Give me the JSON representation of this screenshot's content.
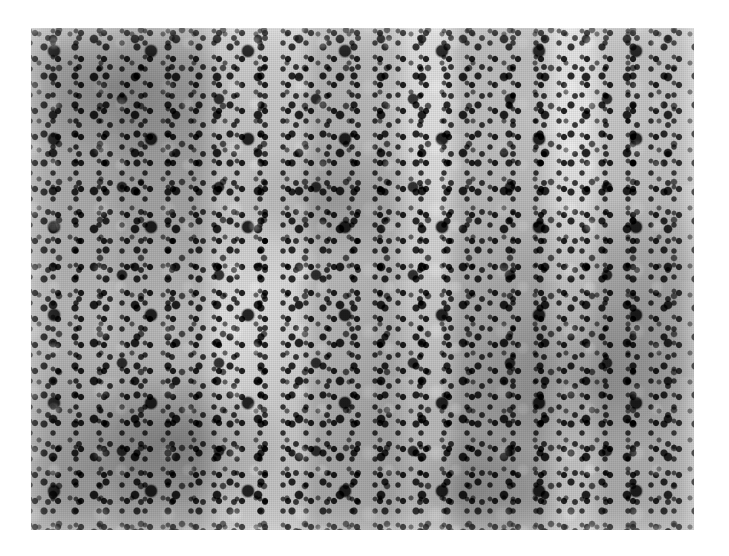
{
  "image": {
    "kind": "photomicrograph",
    "modality": "light-microscopy",
    "staining_appearance": "grayscale halftone print, hematoxylin-eosin-like contrast",
    "subject": "dense cellular infiltrate of small dark-staining nuclei on a pale tissue background",
    "orientation": "landscape",
    "canvas": {
      "width_px": 729,
      "height_px": 556,
      "background_color": "#ffffff"
    },
    "plate": {
      "left_px": 31,
      "top_px": 28,
      "width_px": 663,
      "height_px": 502,
      "border": "none",
      "mean_background_color": "#cfcfcf",
      "darkest_feature_color": "#0a0a0a",
      "lightest_feature_color": "#f2f2f2"
    },
    "features": [
      {
        "name": "small-dark-nuclei",
        "description": "numerous small round hyperchromatic nuclei distributed uniformly across the whole field",
        "approx_diameter_px": 6,
        "color": "#1a1a1a"
      },
      {
        "name": "large-dark-nuclei",
        "description": "scattered larger intensely dark round nuclei, more frequent in the upper-left quadrant",
        "approx_diameter_px": 13,
        "color": "#050505"
      },
      {
        "name": "pale-cytoplasm-halos",
        "description": "light perinuclear clearing and pale sinusoidal spaces between cell clusters",
        "color": "#e8e8e8"
      },
      {
        "name": "fibrous-strands",
        "description": "thin dark horizontal linear strands, likely fibrous septa or collapsed vessels, most visible in the upper-middle and lower-right",
        "color": "#222222"
      },
      {
        "name": "tonal-mottling",
        "description": "broad soft dark and light banding giving an uneven density to the field",
        "color": "#9a9a9a"
      }
    ],
    "text_overlays": [],
    "scale_bar": null,
    "caption": ""
  }
}
